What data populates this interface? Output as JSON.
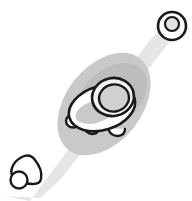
{
  "canvas": {
    "width": 192,
    "height": 201,
    "background_color": "#ffffff",
    "title": "Grayscale line-art illustration of a rounded shelled creature on a shaded ground patch with a beam toward a ringed marker"
  },
  "palette": {
    "ink": "#1a1a1a",
    "beam_gray": "#e6e6e6",
    "ground_gray": "#c9c9c9",
    "shade_gray": "#bdbdbd",
    "body_fill": "#ffffff",
    "dome_fill": "#d0d0d0",
    "dome_rim": "#f2f2f2",
    "marker_fill": "#ffffff",
    "marker_inner_fill": "#e3e3e3"
  },
  "shapes": {
    "beam": {
      "name": "light-beam",
      "label": "Diagonal light beam",
      "fill": "#e6e6e6",
      "points": "5,196 30,201 150,40 168,22 176,34 60,180 40,198"
    },
    "ground_patch": {
      "name": "ground-shadow-patch",
      "label": "Ground shadow patch",
      "fill": "#c9c9c9",
      "cx": 104,
      "cy": 104,
      "rx": 58,
      "ry": 38,
      "rotation": -52
    },
    "inner_shade": {
      "name": "inner-shade-patch",
      "label": "Inner darker shade",
      "fill": "#bdbdbd",
      "cx": 112,
      "cy": 96,
      "rx": 40,
      "ry": 27,
      "rotation": -40
    },
    "creature": {
      "name": "shelled-creature",
      "label": "Shelled creature",
      "body": {
        "name": "creature-body",
        "cx": 102,
        "cy": 108,
        "rx": 34,
        "ry": 22,
        "rotation": -17,
        "fill": "#ffffff",
        "stroke": "#1a1a1a",
        "stroke_width": 2.6
      },
      "belly_shadow": {
        "name": "creature-belly-shadow",
        "cx": 95,
        "cy": 112,
        "rx": 20,
        "ry": 11,
        "rotation": -17,
        "fill": "#c9c9c9"
      },
      "dome": {
        "name": "creature-dome-shell",
        "cx": 113,
        "cy": 97,
        "rx": 21,
        "ry": 19,
        "rotation": -12,
        "fill": "#d0d0d0",
        "stroke": "#1a1a1a",
        "stroke_width": 2.6
      },
      "dome_rim": {
        "name": "creature-dome-rim",
        "cx": 113,
        "cy": 95,
        "rx": 17,
        "ry": 15,
        "rotation": -12,
        "fill": "none",
        "stroke": "#f2f2f2",
        "stroke_width": 4
      },
      "head": {
        "name": "creature-head-nub",
        "cx": 73,
        "cy": 121,
        "rx": 7,
        "ry": 6.5,
        "fill": "#ffffff",
        "stroke": "#1a1a1a",
        "stroke_width": 2.4
      },
      "foot_left": {
        "name": "creature-foot-left",
        "d": "M 83 126 q 2 7 9 8 q 6 0 7 -6",
        "fill": "#ffffff",
        "stroke": "#1a1a1a",
        "stroke_width": 2.4
      },
      "foot_right": {
        "name": "creature-foot-right",
        "d": "M 108 128 q 2 8 10 8 q 7 -1 7 -7",
        "fill": "#ffffff",
        "stroke": "#1a1a1a",
        "stroke_width": 2.4
      }
    },
    "marker": {
      "name": "ringed-marker",
      "label": "Ringed circular marker",
      "cx": 172,
      "cy": 26,
      "outer_r": 14,
      "inner_r": 7,
      "outer_fill": "#ffffff",
      "inner_fill": "#e3e3e3",
      "stroke": "#1a1a1a",
      "outer_stroke_width": 2.6,
      "inner_stroke_width": 2.2
    },
    "cone": {
      "name": "cone-with-ball",
      "label": "Small cone with ball",
      "cone_d": "M 22 157 q 8 -4 13 3 q 8 10 6 19 q -1 5 -8 5 q -12 0 -19 -6 q -4 -4 -2 -10 q 2 -7 10 -11 Z",
      "ball": {
        "cx": 19,
        "cy": 180,
        "r": 8.5
      },
      "fill": "#ffffff",
      "stroke": "#1a1a1a",
      "stroke_width": 2.4
    }
  }
}
